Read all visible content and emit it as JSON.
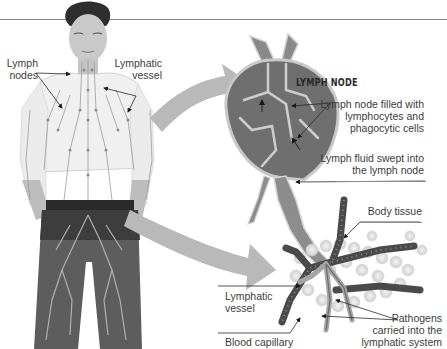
{
  "diagram": {
    "title": "LYMPH NODE",
    "labels": {
      "lymph_nodes": [
        "Lymph",
        "nodes"
      ],
      "lymphatic_vessel_top": [
        "Lymphatic",
        "vessel"
      ],
      "node_filled": [
        "Lymph node filled with",
        "lymphocytes and",
        "phagocytic cells"
      ],
      "fluid_swept": [
        "Lymph fluid swept into",
        "the lymph node"
      ],
      "body_tissue": "Body tissue",
      "lymphatic_vessel_bottom": [
        "Lymphatic",
        "vessel"
      ],
      "blood_capillary": "Blood capillary",
      "pathogens": [
        "Pathogens",
        "carried into the",
        "lymphatic system"
      ]
    },
    "colors": {
      "node_fill": "#6f6f6f",
      "node_rim": "#bdbdbd",
      "arrow_fill": "#b4b4b4",
      "vessel_dark": "#4a4a4a",
      "jeans": "#5a5a5a",
      "shirt": "#f2f2f2",
      "rule": "#8a8a8a"
    }
  }
}
